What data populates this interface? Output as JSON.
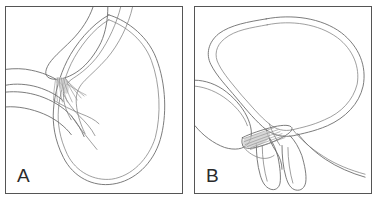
{
  "figure": {
    "type": "two-panel-anatomical-line-diagram",
    "background_color": "#ffffff",
    "line_color": "#6b6b6b",
    "border_color": "#555555",
    "shading_color": "#c9c9c9",
    "label_color": "#2b2b2b"
  },
  "panels": [
    {
      "id": "a",
      "label": "A",
      "description": "Sagittal line drawing of bladder with tubular structures entering from the left and a fan of striated fibers at the junction",
      "structures": [
        "bladder-outline",
        "bladder-inner-wall",
        "upper-organ-mass",
        "upper-tube",
        "lower-tube",
        "fascial-attachment-fan",
        "shaded-junction"
      ]
    },
    {
      "id": "b",
      "label": "B",
      "description": "Sagittal line drawing of a distended bladder above, with two tubular structures descending and a fan of striated fibers at the lower junction",
      "structures": [
        "bladder-outline",
        "bladder-inner-wall",
        "left-organ-mass",
        "descending-tube-left",
        "descending-tube-right",
        "fascial-attachment-fan",
        "shaded-junction"
      ]
    }
  ]
}
